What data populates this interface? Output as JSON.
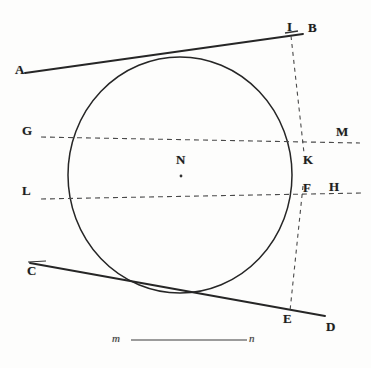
{
  "figure": {
    "background_color": "#fdfdfc",
    "ink_color": "#262626",
    "dashed_color": "#4a4a4a"
  },
  "labels": {
    "A": "A",
    "B": "B",
    "C": "C",
    "D": "D",
    "E": "E",
    "F": "F",
    "G": "G",
    "H": "H",
    "I": "I",
    "K": "K",
    "L": "L",
    "M": "M",
    "N": "N",
    "m": "m",
    "n": "n"
  },
  "geometry": {
    "circle": {
      "center_x": 180,
      "center_y": 175,
      "radius_x": 112,
      "radius_y": 118
    },
    "tangent_upper": {
      "name": "AB",
      "from_label": "A",
      "to_label": "B",
      "x1": 25,
      "y1": 73,
      "x2": 303,
      "y2": 34
    },
    "tangent_lower": {
      "name": "CD",
      "from_label": "C",
      "to_label": "D",
      "x1": 30,
      "y1": 263,
      "x2": 325,
      "y2": 316
    },
    "secant_gkm": {
      "name": "GKM",
      "from_label": "G",
      "through_label": "K",
      "to_label": "M",
      "x1": 41,
      "y1": 137,
      "x2": 360,
      "y2": 143
    },
    "secant_lfh": {
      "name": "LFH",
      "from_label": "L",
      "through_label": "F",
      "to_label": "H",
      "x1": 41,
      "y1": 199,
      "x2": 362,
      "y2": 193
    },
    "perpendicular_ik": {
      "name": "IK",
      "from_label": "I",
      "to_label": "K",
      "x1": 291,
      "y1": 36,
      "x2": 304,
      "y2": 153
    },
    "perpendicular_fe": {
      "name": "FE",
      "from_label": "F",
      "to_label": "E",
      "x1": 303,
      "y1": 186,
      "x2": 290,
      "y2": 311
    },
    "scale_bar": {
      "name": "mn",
      "from_label": "m",
      "to_label": "n",
      "x1": 131,
      "y1": 340,
      "x2": 247,
      "y2": 340
    },
    "tick_I": {
      "x1": 285,
      "y1": 33,
      "x2": 298,
      "y2": 31
    },
    "tick_C": {
      "x1": 28,
      "y1": 262,
      "x2": 46,
      "y2": 261
    },
    "tangent_point_top": {
      "x": 183,
      "y": 58
    },
    "tangent_point_bottom": {
      "x": 170,
      "y": 293
    },
    "intersection_N": {
      "x": 181,
      "y": 176
    }
  },
  "label_positions": {
    "A": {
      "x": 15,
      "y": 63
    },
    "B": {
      "x": 308,
      "y": 21
    },
    "C": {
      "x": 27,
      "y": 264
    },
    "D": {
      "x": 326,
      "y": 320
    },
    "E": {
      "x": 283,
      "y": 312
    },
    "F": {
      "x": 303,
      "y": 181
    },
    "G": {
      "x": 22,
      "y": 124
    },
    "H": {
      "x": 329,
      "y": 180
    },
    "I": {
      "x": 287,
      "y": 20
    },
    "K": {
      "x": 303,
      "y": 153
    },
    "L": {
      "x": 22,
      "y": 184
    },
    "M": {
      "x": 336,
      "y": 125
    },
    "N": {
      "x": 176,
      "y": 153
    },
    "m": {
      "x": 112,
      "y": 333
    },
    "n": {
      "x": 249,
      "y": 333
    }
  }
}
